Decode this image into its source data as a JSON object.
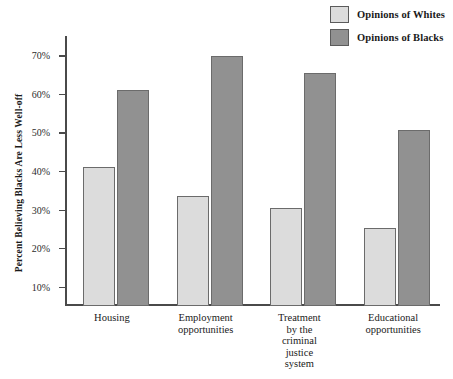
{
  "chart_data": {
    "type": "bar",
    "title": "",
    "xlabel": "",
    "ylabel": "Percent Believing Blacks Are Less Well-off",
    "ylim": [
      5,
      75
    ],
    "ytick_labels": [
      "70%",
      "60%",
      "50%",
      "40%",
      "30%",
      "20%",
      "10%"
    ],
    "yticks": [
      70,
      60,
      50,
      40,
      30,
      20,
      10
    ],
    "grid": false,
    "legend_position": "top-right",
    "categories": [
      "Housing",
      "Employment\nopportunities",
      "Treatment\nby the\ncriminal\njustice\nsystem",
      "Educational\nopportunities"
    ],
    "series": [
      {
        "name": "Opinions of Whites",
        "color": "#dcdcdc",
        "values": [
          41,
          33.5,
          30.5,
          25.3
        ]
      },
      {
        "name": "Opinions of Blacks",
        "color": "#919191",
        "values": [
          61,
          69.7,
          65.3,
          50.7
        ]
      }
    ]
  },
  "legend": {
    "items": [
      {
        "label": "Opinions of Whites",
        "swatch": "light"
      },
      {
        "label": "Opinions of Blacks",
        "swatch": "dark"
      }
    ]
  },
  "colors": {
    "whites_bar": "#dcdcdc",
    "blacks_bar": "#919191",
    "axis": "#4a4a4a",
    "bar_border": "#6b6b6b",
    "background": "#ffffff"
  }
}
